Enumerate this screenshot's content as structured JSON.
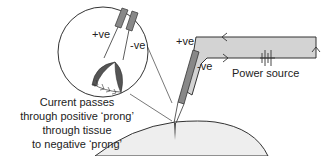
{
  "diagram": {
    "labels": {
      "circle_positive": "+ve",
      "circle_negative": "-ve",
      "probe_positive": "+ve",
      "probe_negative": "-ve",
      "power_source": "Power source"
    },
    "caption": {
      "lines": [
        "Current passes",
        "through positive ‘prong’",
        "through tissue",
        "to negative ‘prong’"
      ]
    },
    "colors": {
      "line": "#333333",
      "probe_fill": "#888888",
      "circuit_fill": "#d3d3d3",
      "tissue_fill": "#eeeeee",
      "prong_tip": "#555555"
    },
    "icons": [
      "battery-icon",
      "arrow-left-icon",
      "arrow-right-icon",
      "arrow-up-icon",
      "magnifier-circle"
    ]
  }
}
